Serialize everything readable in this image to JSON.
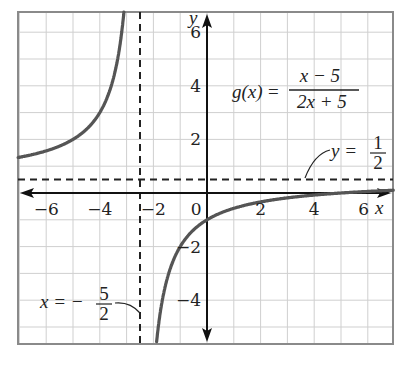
{
  "chart_data": {
    "type": "line",
    "title": "",
    "function_label": {
      "lhs": "g(x)",
      "numerator": "x − 5",
      "denominator": "2x + 5"
    },
    "xlabel": "x",
    "ylabel": "y",
    "xlim": [
      -7,
      7
    ],
    "ylim": [
      -5.6,
      6.75
    ],
    "grid": true,
    "grid_step": 1,
    "x_ticks": [
      {
        "value": -6,
        "label": "−6"
      },
      {
        "value": -4,
        "label": "−4"
      },
      {
        "value": -2,
        "label": "−2"
      },
      {
        "value": 0,
        "label": "0"
      },
      {
        "value": 2,
        "label": "2"
      },
      {
        "value": 4,
        "label": "4"
      },
      {
        "value": 6,
        "label": "6"
      }
    ],
    "y_ticks": [
      {
        "value": 6,
        "label": "6"
      },
      {
        "value": 4,
        "label": "4"
      },
      {
        "value": 2,
        "label": "2"
      },
      {
        "value": -2,
        "label": "−2"
      },
      {
        "value": -4,
        "label": "−4"
      }
    ],
    "asymptotes": {
      "vertical": {
        "x": -2.5,
        "label_lhs": "x = −",
        "label_num": "5",
        "label_den": "2"
      },
      "horizontal": {
        "y": 0.5,
        "label_lhs": "y =",
        "label_num": "1",
        "label_den": "2"
      }
    },
    "series": [
      {
        "name": "g(x) left branch",
        "x": [
          -7,
          -6,
          -5,
          -4,
          -3.5,
          -3.25
        ],
        "y": [
          1.33,
          1.57,
          2.0,
          3.0,
          4.25,
          5.5
        ]
      },
      {
        "name": "g(x) right branch",
        "x": [
          -2,
          -1.5,
          -1,
          0,
          1,
          2,
          4,
          5,
          6,
          7
        ],
        "y": [
          -7.0,
          -3.25,
          -2.0,
          -1.0,
          -0.57,
          -0.33,
          -0.08,
          0.0,
          0.06,
          0.11
        ]
      }
    ],
    "colors": {
      "curve": "#555555",
      "axis": "#111111",
      "grid": "#cfcfcf",
      "border": "#888888",
      "dash": "#222222"
    }
  }
}
